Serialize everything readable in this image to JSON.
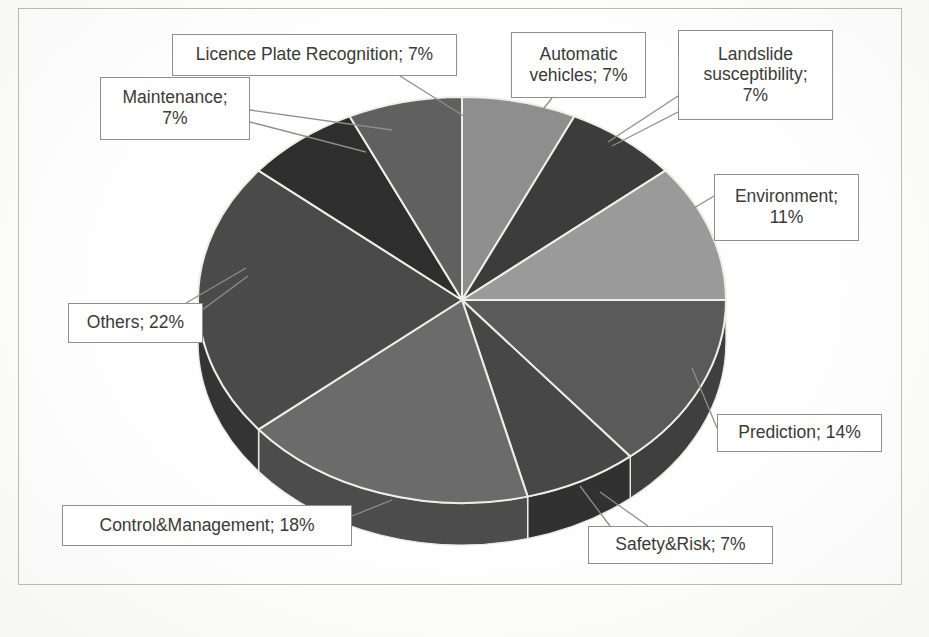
{
  "figure": {
    "background_color": "#fdfdfc",
    "frame_color": "#b9bbb7"
  },
  "chart_data": {
    "type": "pie",
    "title": "",
    "subtitle": "",
    "xlabel": "",
    "ylabel": "",
    "three_d": true,
    "legend_position": "none",
    "label_format": "category; percent",
    "units": "percent",
    "total": 100,
    "start_angle_deg": 0,
    "direction": "clockwise",
    "categories": [
      "Automatic vehicles",
      "Landslide susceptibility",
      "Environment",
      "Prediction",
      "Safety&Risk",
      "Control&Management",
      "Others",
      "Maintenance",
      "Licence Plate Recognition"
    ],
    "values": [
      7,
      7,
      11,
      14,
      7,
      18,
      22,
      7,
      7
    ],
    "slices": [
      {
        "name": "Automatic vehicles",
        "value": 7,
        "label": "Automatic\nvehicles; 7%",
        "color": "#8e8e8e",
        "side_color": "#6e6e6e"
      },
      {
        "name": "Landslide susceptibility",
        "value": 7,
        "label": "Landslide\nsusceptibility;\n7%",
        "color": "#3c3c3c",
        "side_color": "#2a2a2a"
      },
      {
        "name": "Environment",
        "value": 11,
        "label": "Environment;\n11%",
        "color": "#9a9a9a",
        "side_color": "#767676"
      },
      {
        "name": "Prediction",
        "value": 14,
        "label": "Prediction; 14%",
        "color": "#5a5a5a",
        "side_color": "#3f3f3f"
      },
      {
        "name": "Safety&Risk",
        "value": 7,
        "label": "Safety&Risk; 7%",
        "color": "#474747",
        "side_color": "#313131"
      },
      {
        "name": "Control&Management",
        "value": 18,
        "label": "Control&Management; 18%",
        "color": "#6b6b6b",
        "side_color": "#4c4c4c"
      },
      {
        "name": "Others",
        "value": 22,
        "label": "Others; 22%",
        "color": "#4a4a4a",
        "side_color": "#343434"
      },
      {
        "name": "Maintenance",
        "value": 7,
        "label": "Maintenance;\n7%",
        "color": "#2e2e2e",
        "side_color": "#202020"
      },
      {
        "name": "Licence Plate Recognition",
        "value": 7,
        "label": "Licence Plate Recognition; 7%",
        "color": "#606060",
        "side_color": "#444444"
      }
    ]
  },
  "labels": {
    "automatic_vehicles": "Automatic\nvehicles; 7%",
    "landslide": "Landslide\nsusceptibility;\n7%",
    "environment": "Environment;\n11%",
    "prediction": "Prediction; 14%",
    "safety_risk": "Safety&Risk; 7%",
    "control_management": "Control&Management; 18%",
    "others": "Others; 22%",
    "maintenance": "Maintenance;\n7%",
    "licence_plate": "Licence Plate Recognition; 7%"
  }
}
